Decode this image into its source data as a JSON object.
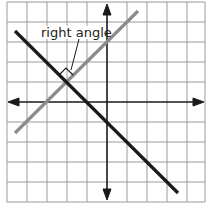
{
  "diagram": {
    "type": "coordinate-plane",
    "grid": {
      "x_min": -5,
      "x_max": 5,
      "y_min": -5,
      "y_max": 5,
      "cell_px": 20,
      "origin_px": [
        107,
        102
      ],
      "grid_color": "#9a9a9a",
      "axis_color": "#1a1a1a"
    },
    "lines": [
      {
        "name": "gray-line",
        "equation": "y = x + 3",
        "color": "#8c8c8c",
        "from": [
          -4.6,
          -1.55
        ],
        "to": [
          1.55,
          4.55
        ]
      },
      {
        "name": "black-line",
        "equation": "y = -x - 1",
        "color": "#1a1a1a",
        "from": [
          -4.6,
          3.55
        ],
        "to": [
          3.55,
          -4.55
        ]
      }
    ],
    "intersection": [
      -2,
      1
    ],
    "annotation": {
      "label": "right angle"
    }
  }
}
